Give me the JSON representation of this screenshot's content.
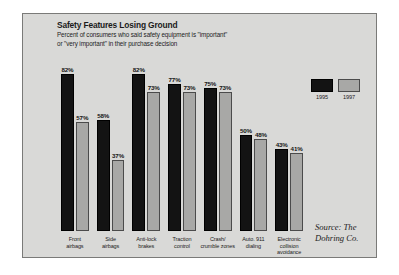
{
  "chart_data": {
    "type": "bar",
    "title": "Safety Features Losing Ground",
    "subtitle_line1": "Percent of consumers who said safety equipment is \"important\"",
    "subtitle_line2": "or \"very important\" in their purchase decision",
    "xlabel": "",
    "ylabel": "",
    "ylim": [
      0,
      90
    ],
    "grid": false,
    "legend_position": "top-right",
    "categories": [
      "Front airbags",
      "Side airbags",
      "Anti-lock brakes",
      "Traction control",
      "Crash/ crumble zones",
      "Auto. 911 dialing",
      "Electronic collision avoidance"
    ],
    "category_lines": [
      [
        "Front",
        "airbags"
      ],
      [
        "Side",
        "airbags"
      ],
      [
        "Anti-lock",
        "brakes"
      ],
      [
        "Traction",
        "control"
      ],
      [
        "Crash/",
        "crumble zones"
      ],
      [
        "Auto. 911",
        "dialing"
      ],
      [
        "Electronic",
        "collision",
        "avoidance"
      ]
    ],
    "series": [
      {
        "name": "1995",
        "color": "#131313",
        "values": [
          82,
          58,
          82,
          77,
          75,
          50,
          43
        ],
        "labels": [
          "82%",
          "58%",
          "82%",
          "77%",
          "75%",
          "50%",
          "43%"
        ]
      },
      {
        "name": "1997",
        "color": "#a8a8a6",
        "values": [
          57,
          37,
          73,
          73,
          73,
          48,
          41
        ],
        "labels": [
          "57%",
          "37%",
          "73%",
          "73%",
          "73%",
          "48%",
          "41%"
        ]
      }
    ]
  },
  "legend": {
    "items": [
      {
        "label": "1995",
        "color": "#131313"
      },
      {
        "label": "1997",
        "color": "#a8a8a6"
      }
    ]
  },
  "source": {
    "line1": "Source: The",
    "line2": "Dohring Co."
  },
  "colors": {
    "panel_background": "#d9d9d7",
    "panel_border": "#7a7a78",
    "bar_1995": "#131313",
    "bar_1997": "#a8a8a6",
    "text": "#1b1b1b"
  }
}
